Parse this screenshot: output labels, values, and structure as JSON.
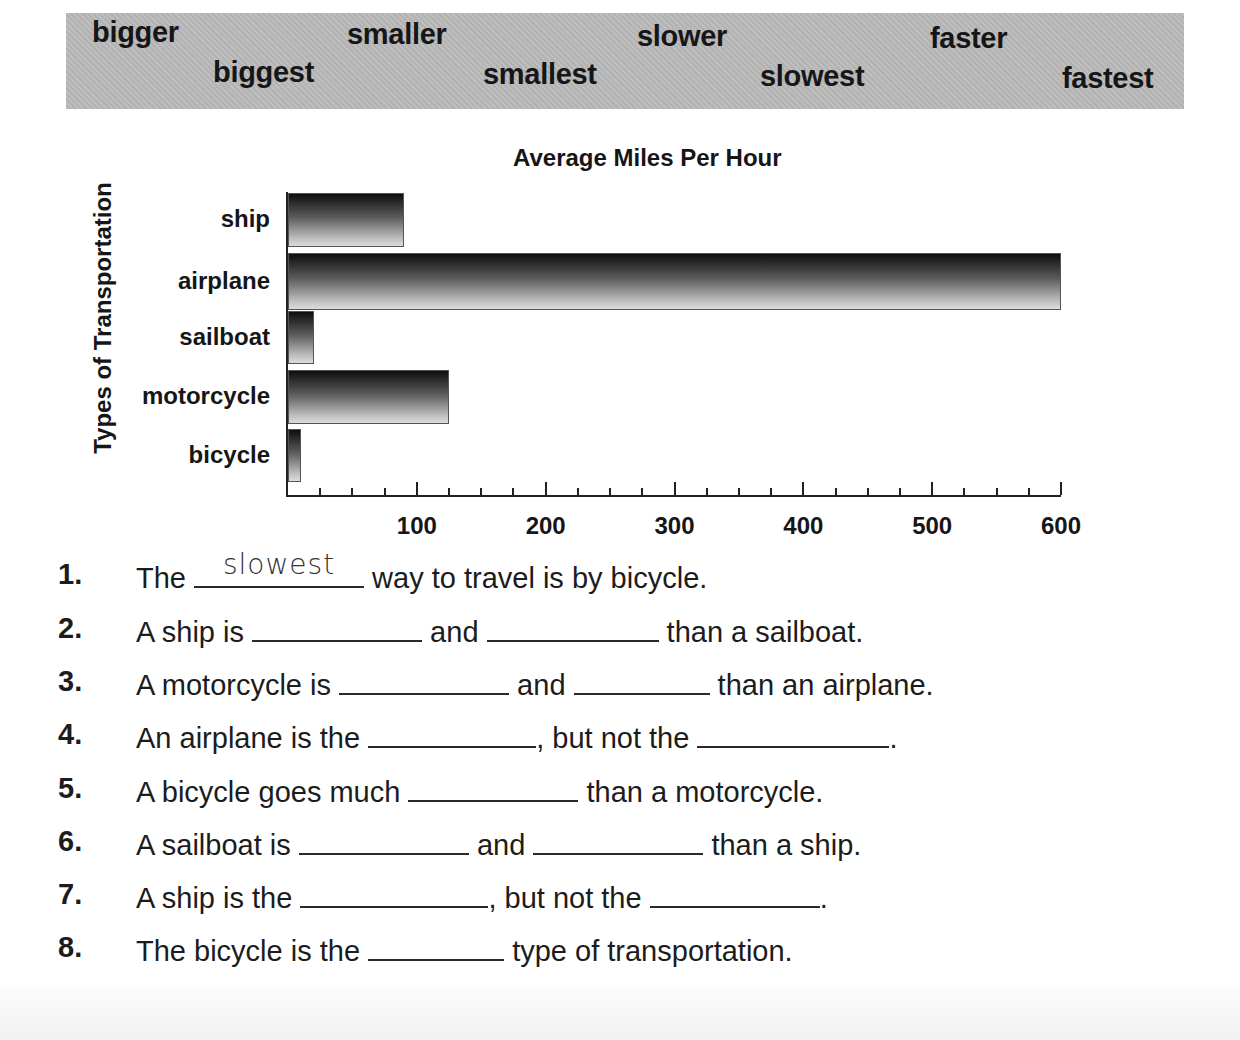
{
  "word_bank": {
    "words": [
      {
        "text": "bigger",
        "x": 92,
        "y": 14
      },
      {
        "text": "biggest",
        "x": 213,
        "y": 54
      },
      {
        "text": "smaller",
        "x": 347,
        "y": 16
      },
      {
        "text": "smallest",
        "x": 483,
        "y": 56
      },
      {
        "text": "slower",
        "x": 637,
        "y": 18
      },
      {
        "text": "slowest",
        "x": 760,
        "y": 58
      },
      {
        "text": "faster",
        "x": 930,
        "y": 20
      },
      {
        "text": "fastest",
        "x": 1062,
        "y": 60
      }
    ]
  },
  "chart_data": {
    "type": "bar",
    "orientation": "horizontal",
    "title": "Average Miles Per Hour",
    "xlabel": "",
    "ylabel": "Types of Transportation",
    "categories": [
      "ship",
      "airplane",
      "sailboat",
      "motorcycle",
      "bicycle"
    ],
    "values": [
      90,
      600,
      20,
      125,
      10
    ],
    "xlim": [
      0,
      600
    ],
    "x_ticks": [
      "100",
      "200",
      "300",
      "400",
      "500",
      "600"
    ],
    "minor_tick_step": 25,
    "grid": false,
    "legend": null
  },
  "questions": [
    {
      "num": "1.",
      "parts": [
        "The ",
        {
          "blank": 170,
          "answer": "slowest"
        },
        " way to travel is by bicycle."
      ]
    },
    {
      "num": "2.",
      "parts": [
        "A ship is ",
        {
          "blank": 170
        },
        " and ",
        {
          "blank": 172
        },
        " than a sailboat."
      ]
    },
    {
      "num": "3.",
      "parts": [
        "A motorcycle is ",
        {
          "blank": 170
        },
        " and ",
        {
          "blank": 136
        },
        " than an airplane."
      ]
    },
    {
      "num": "4.",
      "parts": [
        "An airplane is the ",
        {
          "blank": 168
        },
        ", but not the ",
        {
          "blank": 192
        },
        "."
      ]
    },
    {
      "num": "5.",
      "parts": [
        "A bicycle goes much ",
        {
          "blank": 170
        },
        " than a motorcycle."
      ]
    },
    {
      "num": "6.",
      "parts": [
        "A sailboat is ",
        {
          "blank": 170
        },
        " and ",
        {
          "blank": 170
        },
        " than a ship."
      ]
    },
    {
      "num": "7.",
      "parts": [
        "A ship is the ",
        {
          "blank": 188
        },
        ", but not the ",
        {
          "blank": 170
        },
        "."
      ]
    },
    {
      "num": "8.",
      "parts": [
        "The bicycle is the ",
        {
          "blank": 136
        },
        " type of transportation."
      ]
    }
  ]
}
